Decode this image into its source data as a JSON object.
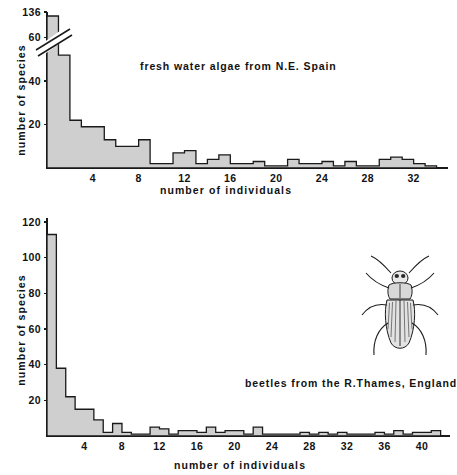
{
  "figure": {
    "name": "species-abundance-histograms",
    "background_color": "#ffffff",
    "ink_color": "#1a1a1a",
    "bar_fill_color": "#cfcfcf"
  },
  "panels": [
    {
      "id": "algae",
      "caption": "fresh water algae from N.E. Spain",
      "xlabel": "number of individuals",
      "ylabel": "number of species"
    },
    {
      "id": "beetles",
      "caption": "beetles from the R.Thames, England",
      "xlabel": "number of individuals",
      "ylabel": "number of species",
      "illustration": "beetle-drawing"
    }
  ],
  "chart_data": [
    {
      "type": "bar",
      "id": "algae",
      "title": "fresh water algae from N.E. Spain",
      "xlabel": "number of individuals",
      "ylabel": "number of species",
      "xlim": [
        0,
        35
      ],
      "ylim": [
        0,
        70
      ],
      "yaxis_break": {
        "present": true,
        "below": 60,
        "top_label": "136",
        "true_top_value": 136
      },
      "xticks": [
        4,
        8,
        12,
        16,
        20,
        24,
        28,
        32
      ],
      "yticks": [
        20,
        40,
        60,
        136
      ],
      "ytick_labels": [
        "20",
        "40",
        "60",
        "136"
      ],
      "grid": false,
      "legend": "none",
      "categories": [
        1,
        2,
        3,
        4,
        5,
        6,
        7,
        8,
        9,
        10,
        11,
        12,
        13,
        14,
        15,
        16,
        17,
        18,
        19,
        20,
        21,
        22,
        23,
        24,
        25,
        26,
        27,
        28,
        29,
        30,
        31,
        32,
        33,
        34
      ],
      "values": [
        136,
        52,
        22,
        19,
        19,
        13,
        10,
        10,
        13,
        2,
        2,
        7,
        8,
        2,
        4,
        6,
        2,
        2,
        3,
        1,
        1,
        4,
        2,
        2,
        3,
        1,
        3,
        1,
        1,
        4,
        5,
        4,
        2,
        1
      ]
    },
    {
      "type": "bar",
      "id": "beetles",
      "title": "beetles from the R.Thames, England",
      "xlabel": "number of individuals",
      "ylabel": "number of species",
      "xlim": [
        0,
        43
      ],
      "ylim": [
        0,
        120
      ],
      "xticks": [
        4,
        8,
        12,
        16,
        20,
        24,
        28,
        32,
        36,
        40
      ],
      "yticks": [
        20,
        40,
        60,
        80,
        100,
        120
      ],
      "ytick_labels": [
        "20",
        "40",
        "60",
        "80",
        "100",
        "120"
      ],
      "grid": false,
      "legend": "none",
      "categories": [
        1,
        2,
        3,
        4,
        5,
        6,
        7,
        8,
        9,
        10,
        11,
        12,
        13,
        14,
        15,
        16,
        17,
        18,
        19,
        20,
        21,
        22,
        23,
        24,
        25,
        26,
        27,
        28,
        29,
        30,
        31,
        32,
        33,
        34,
        35,
        36,
        37,
        38,
        39,
        40,
        41,
        42
      ],
      "values": [
        113,
        38,
        22,
        15,
        15,
        9,
        2,
        7,
        2,
        1,
        1,
        5,
        4,
        1,
        3,
        3,
        2,
        5,
        2,
        3,
        3,
        1,
        5,
        1,
        1,
        1,
        1,
        2,
        1,
        2,
        1,
        2,
        1,
        1,
        1,
        2,
        1,
        3,
        1,
        2,
        2,
        3
      ]
    }
  ]
}
